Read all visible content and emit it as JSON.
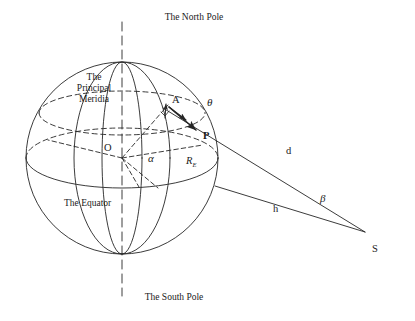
{
  "figure": {
    "type": "geometry-diagram",
    "background_color": "#ffffff",
    "stroke_color": "#262626"
  },
  "labels": {
    "north_pole": "The North Pole",
    "south_pole": "The South Pole",
    "equator": "The Equator",
    "principal_meridian_line1": "The",
    "principal_meridian_line2": "Principal",
    "principal_meridian_line3": "Meridia",
    "center_point": "O",
    "point_a": "A",
    "point_p": "P",
    "point_s": "S",
    "angle_alpha": "α",
    "angle_theta": "θ",
    "angle_beta": "β",
    "radius_earth": "R",
    "radius_earth_subscript": "E",
    "distance_d": "d",
    "altitude_h": "h"
  },
  "geometry": {
    "sphere_center": [
      122,
      158
    ],
    "sphere_radius": 96,
    "point_a": [
      168,
      105
    ],
    "point_p": [
      199,
      131
    ],
    "point_s": [
      365,
      232
    ],
    "equator_ry": 30,
    "latitude_circle_ry": 22,
    "latitude_circle_cy": 113
  }
}
